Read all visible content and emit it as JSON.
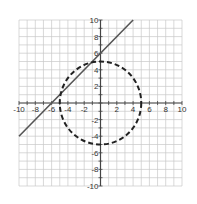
{
  "chart_data": {
    "type": "line",
    "title": "",
    "xlabel": "",
    "ylabel": "",
    "xlim": [
      -10,
      10
    ],
    "ylim": [
      -10,
      10
    ],
    "grid": true,
    "grid_step": 1,
    "x_tick_labels": [
      "-10",
      "-8",
      "-6",
      "-4",
      "-2",
      "2",
      "4",
      "6",
      "8",
      "10"
    ],
    "y_tick_labels": [
      "10",
      "8",
      "6",
      "4",
      "2",
      "-2",
      "-4",
      "-6",
      "-8",
      "-10"
    ],
    "series": [
      {
        "name": "line y = x + 6",
        "style": "solid",
        "color": "#555555",
        "points": [
          [
            -10,
            -4
          ],
          [
            4,
            10
          ]
        ]
      },
      {
        "name": "circle x^2 + y^2 = 25",
        "style": "dashed",
        "color": "#222222",
        "center": [
          0,
          0
        ],
        "radius": 5
      }
    ]
  },
  "colors": {
    "grid": "#c8c8c8",
    "axis": "#444444",
    "background": "#ffffff"
  }
}
